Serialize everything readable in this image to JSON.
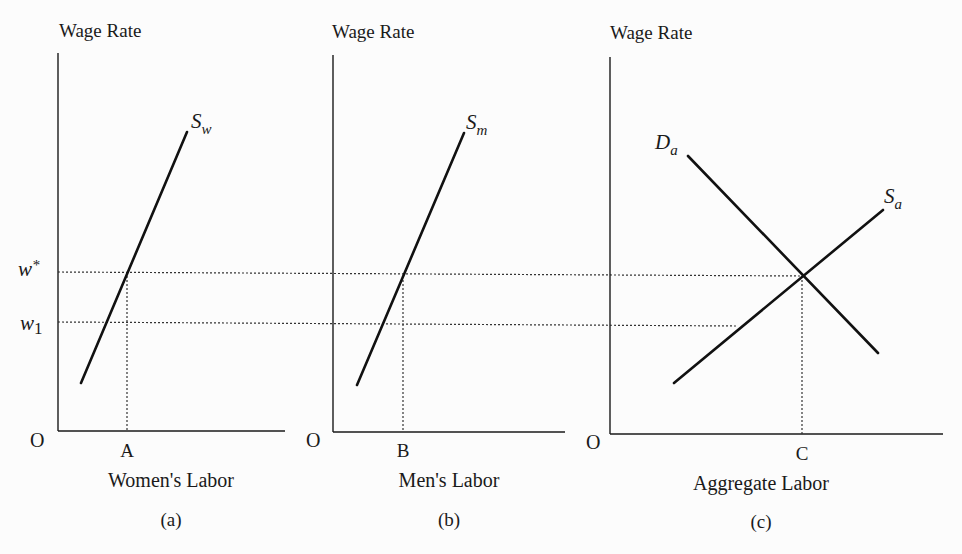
{
  "figure": {
    "panels": [
      {
        "id": "a",
        "caption": "(a)",
        "y_label": "Wage Rate",
        "x_label": "Women's Labor",
        "origin_label": "O",
        "x_tick_label": "A",
        "curves": [
          {
            "name": "S",
            "subscript": "w",
            "type": "supply"
          }
        ]
      },
      {
        "id": "b",
        "caption": "(b)",
        "y_label": "Wage Rate",
        "x_label": "Men's Labor",
        "origin_label": "O",
        "x_tick_label": "B",
        "curves": [
          {
            "name": "S",
            "subscript": "m",
            "type": "supply"
          }
        ]
      },
      {
        "id": "c",
        "caption": "(c)",
        "y_label": "Wage Rate",
        "x_label": "Aggregate Labor",
        "origin_label": "O",
        "x_tick_label": "C",
        "curves": [
          {
            "name": "D",
            "subscript": "a",
            "type": "demand"
          },
          {
            "name": "S",
            "subscript": "a",
            "type": "supply"
          }
        ]
      }
    ],
    "y_levels": [
      {
        "label": "w",
        "superscript": "*"
      },
      {
        "label": "w",
        "subscript": "1"
      }
    ]
  }
}
